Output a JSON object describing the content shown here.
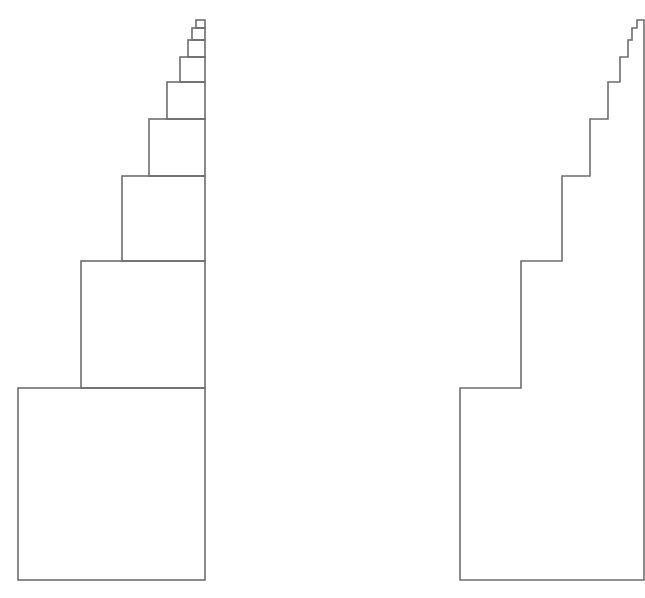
{
  "figure": {
    "width": 645,
    "height": 598,
    "stroke_color": "#6e6e6e",
    "stroke_width": 1.6,
    "background": "#ffffff"
  },
  "left_diagram": {
    "description": "stack of nested squares decreasing in size, right-aligned",
    "right_edge_x": 205,
    "bottom_y": 580,
    "squares": [
      {
        "left": 18,
        "top": 388,
        "bottom": 580
      },
      {
        "left": 81,
        "top": 261,
        "bottom": 388
      },
      {
        "left": 122,
        "top": 176,
        "bottom": 261
      },
      {
        "left": 149,
        "top": 119,
        "bottom": 176
      },
      {
        "left": 167,
        "top": 82,
        "bottom": 119
      },
      {
        "left": 180,
        "top": 57,
        "bottom": 82
      },
      {
        "left": 188,
        "top": 40,
        "bottom": 57
      },
      {
        "left": 192,
        "top": 28,
        "bottom": 40
      },
      {
        "left": 196,
        "top": 20,
        "bottom": 28
      }
    ]
  },
  "right_diagram": {
    "description": "staircase outline (union of the squares)",
    "right_edge_x": 644,
    "bottom_y": 580,
    "steps": [
      {
        "x": 460,
        "y": 388
      },
      {
        "x": 521,
        "y": 261
      },
      {
        "x": 562,
        "y": 176
      },
      {
        "x": 590,
        "y": 119
      },
      {
        "x": 608,
        "y": 82
      },
      {
        "x": 620,
        "y": 57
      },
      {
        "x": 628,
        "y": 40
      },
      {
        "x": 632,
        "y": 28
      },
      {
        "x": 637,
        "y": 20
      }
    ]
  }
}
